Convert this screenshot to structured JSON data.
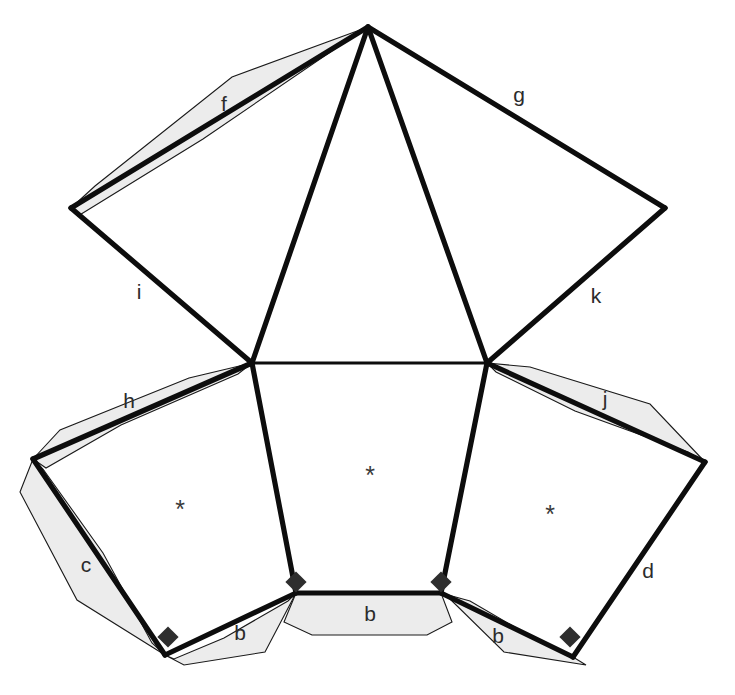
{
  "figure": {
    "background_color": "#ffffff",
    "line_color": "#0d0d0d",
    "band_fill_color": "#ececec",
    "marker_color": "#2e2e2e",
    "label_color": "#2b2b2b",
    "width": 735,
    "height": 695
  },
  "vertices": {
    "apex": {
      "name": "apex",
      "x": 368,
      "y": 27
    },
    "upper_left": {
      "name": "upper-left",
      "x": 71,
      "y": 208
    },
    "upper_right": {
      "name": "upper-right",
      "x": 665,
      "y": 208
    },
    "mid_left": {
      "name": "mid-left",
      "x": 252,
      "y": 363
    },
    "mid_right": {
      "name": "mid-right",
      "x": 487,
      "y": 363
    },
    "far_left": {
      "name": "far-left",
      "x": 33,
      "y": 459
    },
    "far_right": {
      "name": "far-right",
      "x": 705,
      "y": 462
    },
    "bottom_left": {
      "name": "bottom-left",
      "x": 165,
      "y": 655
    },
    "bottom_right": {
      "name": "bottom-right",
      "x": 573,
      "y": 657
    },
    "base_left": {
      "name": "base-left",
      "x": 296,
      "y": 593
    },
    "base_right": {
      "name": "base-right",
      "x": 441,
      "y": 593
    }
  },
  "edge_labels": [
    {
      "id": "f",
      "text": "f",
      "x": 224,
      "y": 105,
      "shaded": true,
      "from": "upper_left",
      "to": "apex"
    },
    {
      "id": "g",
      "text": "g",
      "x": 519,
      "y": 96,
      "shaded": false,
      "from": "apex",
      "to": "upper_right"
    },
    {
      "id": "i",
      "text": "i",
      "x": 139,
      "y": 293,
      "shaded": false,
      "from": "upper_left",
      "to": "mid_left"
    },
    {
      "id": "k",
      "text": "k",
      "x": 596,
      "y": 297,
      "shaded": false,
      "from": "mid_right",
      "to": "upper_right"
    },
    {
      "id": "h",
      "text": "h",
      "x": 129,
      "y": 402,
      "shaded": true,
      "from": "far_left",
      "to": "mid_left"
    },
    {
      "id": "j",
      "text": "j",
      "x": 605,
      "y": 400,
      "shaded": true,
      "from": "mid_right",
      "to": "far_right"
    },
    {
      "id": "c",
      "text": "c",
      "x": 86,
      "y": 566,
      "shaded": true,
      "from": "far_left",
      "to": "bottom_left"
    },
    {
      "id": "d",
      "text": "d",
      "x": 648,
      "y": 572,
      "shaded": false,
      "from": "far_right",
      "to": "bottom_right"
    },
    {
      "id": "b1",
      "text": "b",
      "x": 240,
      "y": 634,
      "shaded": true,
      "from": "bottom_left",
      "to": "base_left"
    },
    {
      "id": "b2",
      "text": "b",
      "x": 370,
      "y": 615,
      "shaded": true,
      "from": "base_left",
      "to": "base_right"
    },
    {
      "id": "b3",
      "text": "b",
      "x": 498,
      "y": 637,
      "shaded": true,
      "from": "base_right",
      "to": "bottom_right"
    }
  ],
  "face_markers": [
    {
      "id": "face-left",
      "text": "*",
      "x": 180,
      "y": 511
    },
    {
      "id": "face-center",
      "text": "*",
      "x": 370,
      "y": 477
    },
    {
      "id": "face-right",
      "text": "*",
      "x": 550,
      "y": 516
    }
  ],
  "vertex_markers": [
    {
      "id": "diamond-bottom-left",
      "x": 168,
      "y": 637
    },
    {
      "id": "diamond-base-left",
      "x": 296,
      "y": 582
    },
    {
      "id": "diamond-base-right",
      "x": 441,
      "y": 582
    },
    {
      "id": "diamond-bottom-right",
      "x": 570,
      "y": 637
    }
  ],
  "bands": {
    "f": "71,208 95,186 232,77 368,27 345,42 203,139 78,216",
    "h": "33,459 60,430 189,378 252,363 238,374 121,425 46,468",
    "j": "487,363 530,367 650,404 705,462 688,452 575,411 496,372",
    "c": "33,459 20,492 77,600 165,655 152,643 103,553 43,469",
    "b1": "165,655 184,665 265,652 296,593 288,601 224,638 174,659",
    "b2": "296,593 284,622 312,635 427,635 452,622 441,593",
    "b3": "441,593 470,601 535,639 573,657 586,665 504,652 449,598"
  },
  "faces": {
    "upper_kite": "71,208 368,27 665,208 487,363 252,363",
    "center": "252,363 487,363 441,593 296,593",
    "left": "33,459 252,363 296,593 165,655",
    "right": "487,363 705,462 573,657 441,593"
  },
  "edges_thick": [
    {
      "id": "edge-f",
      "points": "71,208 368,27"
    },
    {
      "id": "edge-g",
      "points": "368,27 665,208"
    },
    {
      "id": "edge-i",
      "points": "71,208 252,363"
    },
    {
      "id": "edge-k",
      "points": "665,208 487,363"
    },
    {
      "id": "edge-apex-midleft",
      "points": "368,27 252,363"
    },
    {
      "id": "edge-apex-midright",
      "points": "368,27 487,363"
    },
    {
      "id": "edge-h",
      "points": "33,459 252,363"
    },
    {
      "id": "edge-j",
      "points": "487,363 705,462"
    },
    {
      "id": "edge-c",
      "points": "33,459 165,655"
    },
    {
      "id": "edge-d",
      "points": "705,462 573,657"
    },
    {
      "id": "edge-b1",
      "points": "165,655 296,593"
    },
    {
      "id": "edge-b2",
      "points": "296,593 441,593"
    },
    {
      "id": "edge-b3",
      "points": "441,593 573,657"
    },
    {
      "id": "edge-center-left",
      "points": "252,363 296,593"
    },
    {
      "id": "edge-center-right",
      "points": "487,363 441,593"
    }
  ],
  "edges_thin": [
    {
      "id": "edge-midline",
      "points": "252,363 487,363"
    }
  ]
}
